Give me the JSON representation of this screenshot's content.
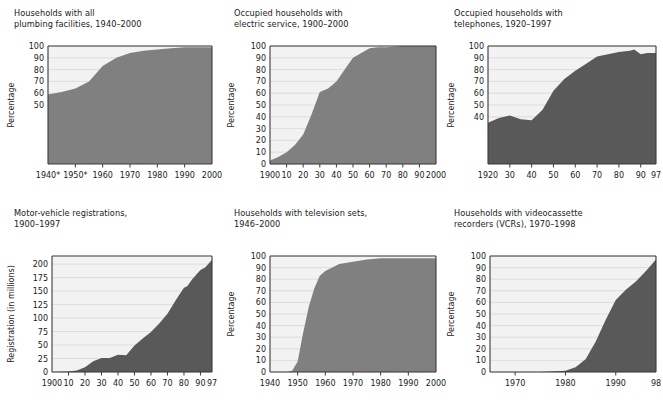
{
  "figure": {
    "background": "#ffffff",
    "plot_background": "#f2f2f2",
    "gridline_color": "#d8d8d8",
    "axis_color": "#3a3a3a",
    "fill_light": "#808080",
    "fill_dark": "#595959",
    "text_color": "#1a1a1a"
  },
  "charts": [
    {
      "id": "plumbing",
      "title": "Households with all\nplumbing facilities, 1940–2000",
      "chart_data": {
        "type": "area",
        "title": "Households with all plumbing facilities, 1940–2000",
        "xlabel": "",
        "ylabel": "Percentage",
        "fill": "#808080",
        "grid": true,
        "legend": null,
        "xlim": [
          1940,
          2000
        ],
        "ylim": [
          0,
          100
        ],
        "ytick_values": [
          50,
          60,
          70,
          80,
          90,
          100
        ],
        "ytick_labels": [
          "50",
          "60",
          "70",
          "80",
          "90",
          "100"
        ],
        "ygrid_values": [
          50,
          60,
          70,
          80,
          90,
          100
        ],
        "xtick_values": [
          1940,
          1950,
          1960,
          1970,
          1980,
          1990,
          2000
        ],
        "xtick_labels": [
          "1940*",
          "1950*",
          "1960",
          "1970",
          "1980",
          "1990",
          "2000"
        ],
        "x": [
          1940,
          1945,
          1950,
          1955,
          1960,
          1965,
          1970,
          1975,
          1980,
          1985,
          1990,
          1995,
          2000
        ],
        "values": [
          59,
          61,
          64,
          70,
          83,
          90,
          94,
          96,
          97,
          98,
          99,
          99,
          99
        ]
      }
    },
    {
      "id": "electric",
      "title": "Occupied households with\nelectric service, 1900–2000",
      "chart_data": {
        "type": "area",
        "title": "Occupied households with electric service, 1900–2000",
        "xlabel": "",
        "ylabel": "Percentage",
        "fill": "#808080",
        "grid": true,
        "legend": null,
        "xlim": [
          1900,
          2000
        ],
        "ylim": [
          0,
          100
        ],
        "ytick_values": [
          0,
          10,
          20,
          30,
          40,
          50,
          60,
          70,
          80,
          90,
          100
        ],
        "ytick_labels": [
          "0",
          "10",
          "20",
          "30",
          "40",
          "50",
          "60",
          "70",
          "80",
          "90",
          "100"
        ],
        "ygrid_values": [
          0,
          10,
          20,
          30,
          40,
          50,
          60,
          70,
          80,
          90,
          100
        ],
        "xtick_values": [
          1900,
          1910,
          1920,
          1930,
          1940,
          1950,
          1960,
          1970,
          1980,
          1990,
          2000
        ],
        "xtick_labels": [
          "1900",
          "10",
          "20",
          "30",
          "40",
          "50",
          "60",
          "70",
          "80",
          "90",
          "2000"
        ],
        "x": [
          1900,
          1905,
          1910,
          1915,
          1920,
          1925,
          1930,
          1935,
          1940,
          1945,
          1950,
          1955,
          1960,
          1965,
          1970,
          1980,
          1990,
          2000
        ],
        "values": [
          3,
          6,
          10,
          16,
          25,
          42,
          61,
          64,
          70,
          80,
          90,
          94,
          98,
          99,
          99,
          100,
          100,
          100
        ]
      }
    },
    {
      "id": "telephones",
      "title": "Occupied households with\ntelephones, 1920–1997",
      "chart_data": {
        "type": "area",
        "title": "Occupied households with telephones, 1920–1997",
        "xlabel": "",
        "ylabel": "Percentage",
        "fill": "#595959",
        "grid": true,
        "legend": null,
        "xlim": [
          1920,
          1997
        ],
        "ylim": [
          0,
          100
        ],
        "ytick_values": [
          40,
          50,
          60,
          70,
          80,
          90,
          100
        ],
        "ytick_labels": [
          "40",
          "50",
          "60",
          "70",
          "80",
          "90",
          "100"
        ],
        "ygrid_values": [
          40,
          50,
          60,
          70,
          80,
          90,
          100
        ],
        "xtick_values": [
          1920,
          1930,
          1940,
          1950,
          1960,
          1970,
          1980,
          1990,
          1997
        ],
        "xtick_labels": [
          "1920",
          "30",
          "40",
          "50",
          "60",
          "70",
          "80",
          "90",
          "97"
        ],
        "x": [
          1920,
          1925,
          1930,
          1935,
          1940,
          1945,
          1950,
          1955,
          1960,
          1965,
          1970,
          1975,
          1980,
          1985,
          1987,
          1990,
          1993,
          1997
        ],
        "values": [
          35,
          39,
          41,
          38,
          37,
          46,
          62,
          72,
          79,
          85,
          91,
          93,
          95,
          96,
          97,
          93,
          94,
          94
        ]
      }
    },
    {
      "id": "motor-vehicles",
      "title": "Motor-vehicle registrations,\n1900–1997",
      "chart_data": {
        "type": "area",
        "title": "Motor-vehicle registrations, 1900–1997",
        "xlabel": "",
        "ylabel": "Registration (in millions)",
        "fill": "#595959",
        "grid": true,
        "legend": null,
        "xlim": [
          1900,
          1997
        ],
        "ylim": [
          0,
          215
        ],
        "ytick_values": [
          0,
          25,
          50,
          75,
          100,
          125,
          150,
          175,
          200
        ],
        "ytick_labels": [
          "0",
          "25",
          "50",
          "75",
          "100",
          "125",
          "150",
          "175",
          "200"
        ],
        "ygrid_values": [
          0,
          25,
          50,
          75,
          100,
          125,
          150,
          175,
          200
        ],
        "xtick_values": [
          1900,
          1910,
          1920,
          1930,
          1940,
          1950,
          1960,
          1970,
          1980,
          1990,
          1997
        ],
        "xtick_labels": [
          "1900",
          "10",
          "20",
          "30",
          "40",
          "50",
          "60",
          "70",
          "80",
          "90",
          "97"
        ],
        "x": [
          1900,
          1910,
          1915,
          1920,
          1925,
          1930,
          1935,
          1940,
          1945,
          1950,
          1955,
          1960,
          1965,
          1970,
          1975,
          1980,
          1982,
          1985,
          1990,
          1993,
          1995,
          1997
        ],
        "values": [
          0,
          1,
          3,
          9,
          20,
          26,
          26,
          32,
          31,
          49,
          62,
          74,
          90,
          108,
          133,
          156,
          159,
          172,
          189,
          194,
          201,
          208
        ]
      }
    },
    {
      "id": "television",
      "title": "Households with television sets,\n1946–2000",
      "chart_data": {
        "type": "area",
        "title": "Households with television sets, 1946–2000",
        "xlabel": "",
        "ylabel": "Percentage",
        "fill": "#808080",
        "grid": true,
        "legend": null,
        "xlim": [
          1940,
          2000
        ],
        "ylim": [
          0,
          100
        ],
        "ytick_values": [
          0,
          10,
          20,
          30,
          40,
          50,
          60,
          70,
          80,
          90,
          100
        ],
        "ytick_labels": [
          "0",
          "10",
          "20",
          "30",
          "40",
          "50",
          "60",
          "70",
          "80",
          "90",
          "100"
        ],
        "ygrid_values": [
          0,
          10,
          20,
          30,
          40,
          50,
          60,
          70,
          80,
          90,
          100
        ],
        "xtick_values": [
          1940,
          1950,
          1960,
          1970,
          1980,
          1990,
          2000
        ],
        "xtick_labels": [
          "1940",
          "1950",
          "1960",
          "1970",
          "1980",
          "1990",
          "2000"
        ],
        "x": [
          1946,
          1948,
          1950,
          1952,
          1954,
          1956,
          1958,
          1960,
          1965,
          1970,
          1975,
          1980,
          1985,
          1990,
          1995,
          2000
        ],
        "values": [
          0,
          1,
          9,
          34,
          56,
          72,
          83,
          87,
          93,
          95,
          97,
          98,
          98,
          98,
          98,
          98
        ]
      }
    },
    {
      "id": "vcr",
      "title": "Households with videocassette\nrecorders (VCRs), 1970–1998",
      "chart_data": {
        "type": "area",
        "title": "Households with videocassette recorders (VCRs), 1970–1998",
        "xlabel": "",
        "ylabel": "Percentage",
        "fill": "#595959",
        "grid": true,
        "legend": null,
        "xlim": [
          1965,
          1998
        ],
        "ylim": [
          0,
          100
        ],
        "ytick_values": [
          0,
          10,
          20,
          30,
          40,
          50,
          60,
          70,
          80,
          90,
          100
        ],
        "ytick_labels": [
          "0",
          "10",
          "20",
          "30",
          "40",
          "50",
          "60",
          "70",
          "80",
          "90",
          "100"
        ],
        "ygrid_values": [
          0,
          10,
          20,
          30,
          40,
          50,
          60,
          70,
          80,
          90,
          100
        ],
        "xtick_values": [
          1970,
          1980,
          1990,
          1998
        ],
        "xtick_labels": [
          "1970",
          "1980",
          "1990",
          "98"
        ],
        "x": [
          1965,
          1970,
          1975,
          1980,
          1982,
          1984,
          1986,
          1988,
          1990,
          1992,
          1994,
          1996,
          1998
        ],
        "values": [
          0,
          0,
          0,
          1,
          4,
          11,
          26,
          45,
          62,
          71,
          78,
          87,
          97
        ]
      }
    }
  ]
}
